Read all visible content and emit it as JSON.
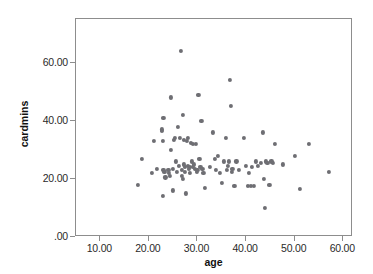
{
  "chart_data": {
    "type": "scatter",
    "title": "",
    "xlabel": "age",
    "ylabel": "cardmins",
    "xlim": [
      5,
      62
    ],
    "ylim": [
      0,
      75
    ],
    "grid": false,
    "legend": "none",
    "marker": {
      "shape": "circle",
      "color": "#6e6e73",
      "size_px": 4
    },
    "axes": {
      "x_ticks": [
        10,
        20,
        30,
        40,
        50,
        60
      ],
      "x_tick_labels": [
        "10.00",
        "20.00",
        "30.00",
        "40.00",
        "50.00",
        "60.00"
      ],
      "y_ticks": [
        0,
        20,
        40,
        60
      ],
      "y_tick_labels": [
        ".00",
        "20.00",
        "40.00",
        "60.00"
      ]
    },
    "n_points": 101,
    "x": [
      17.8,
      18.6,
      20.6,
      21.0,
      21.6,
      22.6,
      22.6,
      22.8,
      22.8,
      23.0,
      23.0,
      23.2,
      23.4,
      24.0,
      24.2,
      24.4,
      24.6,
      24.6,
      25.0,
      25.0,
      25.2,
      25.4,
      25.6,
      25.8,
      26.0,
      26.2,
      26.4,
      26.6,
      26.8,
      26.8,
      27.0,
      27.0,
      27.2,
      27.2,
      27.4,
      27.4,
      27.6,
      27.8,
      28.0,
      28.0,
      28.2,
      28.4,
      28.4,
      28.6,
      28.8,
      29.0,
      29.0,
      29.2,
      29.4,
      29.6,
      29.8,
      30.0,
      30.2,
      30.4,
      30.6,
      30.8,
      31.0,
      31.2,
      31.6,
      32.6,
      33.2,
      33.6,
      33.8,
      34.2,
      34.6,
      35.0,
      35.4,
      35.8,
      36.0,
      36.2,
      36.4,
      36.6,
      36.8,
      37.0,
      37.2,
      37.6,
      38.0,
      38.6,
      39.6,
      40.0,
      40.4,
      40.6,
      41.0,
      41.2,
      41.6,
      42.0,
      42.4,
      43.0,
      43.4,
      43.6,
      43.8,
      44.0,
      44.4,
      44.8,
      45.2,
      45.6,
      46.0,
      47.6,
      50.0,
      51.0,
      53.0,
      57.0
    ],
    "y": [
      18.0,
      27.0,
      22.0,
      33.0,
      23.5,
      37.0,
      36.5,
      33.0,
      14.0,
      23.0,
      41.0,
      22.5,
      20.5,
      23.0,
      22.0,
      21.0,
      30.0,
      48.0,
      23.5,
      16.0,
      33.5,
      34.0,
      26.0,
      22.5,
      38.0,
      24.5,
      34.0,
      64.0,
      23.0,
      21.0,
      42.0,
      20.0,
      33.5,
      25.0,
      24.0,
      22.5,
      15.0,
      33.0,
      34.0,
      24.5,
      23.5,
      24.0,
      22.0,
      32.5,
      26.0,
      32.0,
      24.0,
      25.0,
      23.5,
      32.0,
      22.5,
      23.0,
      49.0,
      27.0,
      24.0,
      40.0,
      23.5,
      22.0,
      17.0,
      24.0,
      36.0,
      27.0,
      23.0,
      28.0,
      22.0,
      18.5,
      26.0,
      34.0,
      23.0,
      24.5,
      26.0,
      54.0,
      45.0,
      22.5,
      23.5,
      17.5,
      26.0,
      23.0,
      34.0,
      24.5,
      17.5,
      22.0,
      17.5,
      24.0,
      17.5,
      26.0,
      24.5,
      25.5,
      36.0,
      20.0,
      10.0,
      26.0,
      25.5,
      18.0,
      26.0,
      25.5,
      32.0,
      25.0,
      28.0,
      16.5,
      32.0,
      22.5
    ]
  }
}
